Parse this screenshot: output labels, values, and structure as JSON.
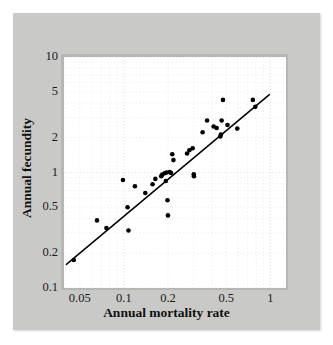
{
  "figure": {
    "frame_color": "#c9c9c7",
    "panel_color": "#ffffff",
    "marker_color": "#000000",
    "line_color": "#000000",
    "grid_color": "#d8d8d8"
  },
  "chart_data": {
    "type": "scatter",
    "title": "",
    "subtitle": "",
    "xlabel": "Annual mortality rate",
    "ylabel": "Annual fecundity",
    "xscale": "log",
    "yscale": "log",
    "xlim": [
      0.039,
      1.28
    ],
    "ylim": [
      0.1,
      10
    ],
    "xticks": [
      0.05,
      0.1,
      0.2,
      0.5,
      1
    ],
    "xtick_labels": [
      "0.05",
      "0.1",
      "0.2",
      "0.5",
      "1"
    ],
    "yticks": [
      0.1,
      0.2,
      0.5,
      1,
      2,
      5,
      10
    ],
    "ytick_labels": [
      "0.1",
      "0.2",
      "0.5",
      "1",
      "2",
      "5",
      "10"
    ],
    "grid": true,
    "grid_style": "dotted-minor",
    "legend": false,
    "legend_position": "none",
    "marker": "filled-circle",
    "marker_size_px": 4.6,
    "series": [
      {
        "name": "species",
        "points": [
          [
            0.0455,
            0.175
          ],
          [
            0.0655,
            0.385
          ],
          [
            0.076,
            0.33
          ],
          [
            0.0985,
            0.86
          ],
          [
            0.106,
            0.5
          ],
          [
            0.1075,
            0.315
          ],
          [
            0.119,
            0.76
          ],
          [
            0.14,
            0.665
          ],
          [
            0.157,
            0.79
          ],
          [
            0.164,
            0.88
          ],
          [
            0.18,
            0.93
          ],
          [
            0.183,
            0.96
          ],
          [
            0.19,
            0.985
          ],
          [
            0.1935,
            0.845
          ],
          [
            0.196,
            1.0
          ],
          [
            0.1985,
            0.575
          ],
          [
            0.2,
            0.425
          ],
          [
            0.206,
            1.01
          ],
          [
            0.21,
            0.99
          ],
          [
            0.214,
            1.44
          ],
          [
            0.218,
            1.28
          ],
          [
            0.27,
            1.46
          ],
          [
            0.28,
            1.56
          ],
          [
            0.295,
            1.62
          ],
          [
            0.3,
            0.965
          ],
          [
            0.301,
            0.93
          ],
          [
            0.345,
            2.23
          ],
          [
            0.37,
            2.82
          ],
          [
            0.41,
            2.5
          ],
          [
            0.43,
            2.43
          ],
          [
            0.455,
            2.05
          ],
          [
            0.46,
            2.13
          ],
          [
            0.465,
            2.82
          ],
          [
            0.475,
            4.25
          ],
          [
            0.51,
            2.58
          ],
          [
            0.595,
            2.4
          ],
          [
            0.76,
            4.25
          ],
          [
            0.79,
            3.7
          ]
        ]
      }
    ],
    "fit_line": {
      "name": "regression line",
      "x_start": 0.0405,
      "y_start": 0.16,
      "x_end": 0.985,
      "y_end": 4.72
    }
  }
}
